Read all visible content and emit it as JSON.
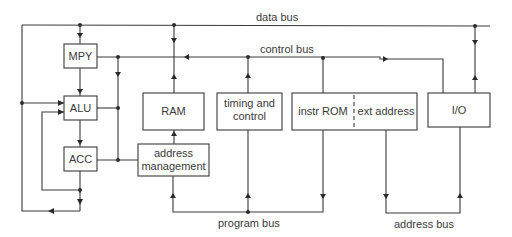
{
  "diagram": {
    "type": "microprocessor-block-diagram",
    "blocks": {
      "mpy": "MPY",
      "alu": "ALU",
      "acc": "ACC",
      "ram": "RAM",
      "timing_line1": "timing and",
      "timing_line2": "control",
      "instr_rom": "instr ROM",
      "ext_address": "ext address",
      "io": "I/O",
      "addr_mgmt_line1": "address",
      "addr_mgmt_line2": "management"
    },
    "buses": {
      "data_bus": "data bus",
      "control_bus": "control bus",
      "program_bus": "program bus",
      "address_bus": "address bus"
    }
  }
}
